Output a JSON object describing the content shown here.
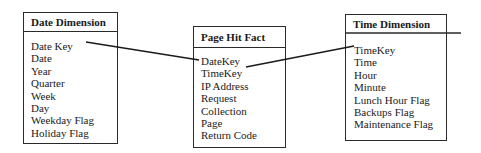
{
  "entities": {
    "date": {
      "title": "Date Dimension",
      "fields": [
        "Date Key",
        "Date",
        "Year",
        "Quarter",
        "Week",
        "Day",
        "Weekday Flag",
        "Holiday Flag"
      ]
    },
    "fact": {
      "title": "Page Hit Fact",
      "fields": [
        "DateKey",
        "TimeKey",
        "IP Address",
        "Request",
        "Collection",
        "Page",
        "Return Code"
      ]
    },
    "time": {
      "title": "Time Dimension",
      "fields": [
        "TimeKey",
        "Time",
        "Hour",
        "Minute",
        "Lunch Hour Flag",
        "Backups Flag",
        "Maintenance Flag"
      ]
    }
  },
  "relationships": [
    {
      "from": "Date Dimension.Date Key",
      "to": "Page Hit Fact.DateKey"
    },
    {
      "from": "Page Hit Fact.TimeKey",
      "to": "Time Dimension.TimeKey"
    }
  ]
}
